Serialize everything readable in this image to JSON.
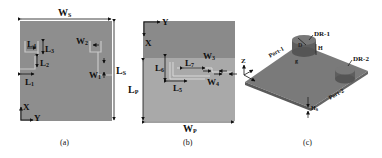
{
  "colors": {
    "substrate_a": "#8e8e8e",
    "patch_b_top": "#8a8a8a",
    "patch_b_bottom": "#a9a9a9",
    "feed_line": "#c8c8c8",
    "board_3d": "#777777",
    "dr": "#6a6a6a",
    "dim_line": "#111111"
  },
  "panel_a": {
    "caption": "(a)",
    "width_label": "W",
    "width_sub": "S",
    "length_label": "L",
    "length_sub": "S",
    "dims": {
      "l4": {
        "main": "L",
        "sub": "4"
      },
      "l3": {
        "main": "L",
        "sub": "3"
      },
      "l2": {
        "main": "L",
        "sub": "2"
      },
      "l1": {
        "main": "L",
        "sub": "1"
      },
      "w2": {
        "main": "W",
        "sub": "2"
      },
      "w1": {
        "main": "W",
        "sub": "1"
      }
    },
    "axis_x": "X",
    "axis_y": "Y"
  },
  "panel_b": {
    "caption": "(b)",
    "width_label": "W",
    "width_sub": "P",
    "length_label": "L",
    "length_sub": "P",
    "dims": {
      "l6": {
        "main": "L",
        "sub": "6"
      },
      "l7": {
        "main": "L",
        "sub": "7"
      },
      "l5": {
        "main": "L",
        "sub": "5"
      },
      "w3": {
        "main": "W",
        "sub": "3"
      },
      "w4": {
        "main": "W",
        "sub": "4"
      }
    },
    "axis_x": "X",
    "axis_y": "Y"
  },
  "panel_c": {
    "caption": "(c)",
    "dr1_label": "DR-1",
    "dr2_label": "DR-2",
    "port1_label": "Port-1",
    "port2_label": "Port-2",
    "d_label": "D",
    "h_label": "H",
    "g_label": "g",
    "hs_label": "H",
    "hs_sub": "s",
    "axis_z": "Z",
    "axis_x": "X",
    "axis_y": "Y"
  }
}
